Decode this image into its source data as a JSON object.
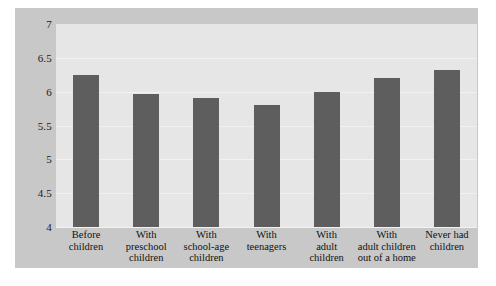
{
  "chart_data": {
    "type": "bar",
    "title": "",
    "subtitle": "",
    "xlabel": "",
    "ylabel": "",
    "categories": [
      "Before children",
      "With preschool children",
      "With school-age children",
      "With teenagers",
      "With adult children",
      "With adult children out of a home",
      "Never had children"
    ],
    "category_lines": [
      [
        "Before",
        "children"
      ],
      [
        "With",
        "preschool",
        "children"
      ],
      [
        "With",
        "school-age",
        "children"
      ],
      [
        "With",
        "teenagers"
      ],
      [
        "With",
        "adult",
        "children"
      ],
      [
        "With",
        "adult children",
        "out of a home"
      ],
      [
        "Never had",
        "children"
      ]
    ],
    "values": [
      6.25,
      5.97,
      5.9,
      5.8,
      6.0,
      6.2,
      6.32
    ],
    "ylim": [
      4,
      7
    ],
    "ytick_values": [
      4,
      4.5,
      5,
      5.5,
      6,
      6.5,
      7
    ],
    "ytick_labels": [
      "4",
      "4.5",
      "5",
      "5.5",
      "6",
      "6.5",
      "7"
    ],
    "grid": true,
    "legend": null,
    "bar_color": "#5e5e5e",
    "plot_background": "#e6e6e6",
    "figure_background": "#c8c8c8",
    "gridline_color": "#f2f2f2"
  }
}
